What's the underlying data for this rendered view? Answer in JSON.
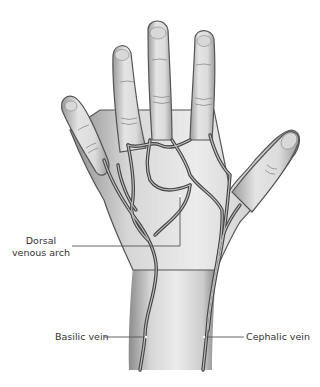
{
  "figure": {
    "colors": {
      "skin_light": "#eeeeee",
      "skin_mid": "#cfcfcf",
      "skin_dark": "#8a8a8a",
      "vein": "#444444",
      "vein_core": "#bdbdbd",
      "leader_line": "#555555"
    }
  },
  "labels": {
    "dorsal_venous_arch_line1": "Dorsal",
    "dorsal_venous_arch_line2": "venous arch",
    "basilic_vein": "Basilic vein",
    "cephalic_vein": "Cephalic vein"
  }
}
